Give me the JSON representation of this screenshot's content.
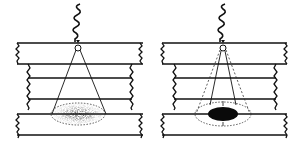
{
  "figure": {
    "panels": [
      {
        "id": "left",
        "label": "diffuse spot",
        "offset_x": 0,
        "spot_style": "stippled-diffuse"
      },
      {
        "id": "right",
        "label": "focused spot",
        "offset_x": 152,
        "spot_style": "solid-focused"
      }
    ],
    "colors": {
      "ink": "#111111",
      "paper": "#ffffff",
      "stipple": "#222222"
    }
  }
}
